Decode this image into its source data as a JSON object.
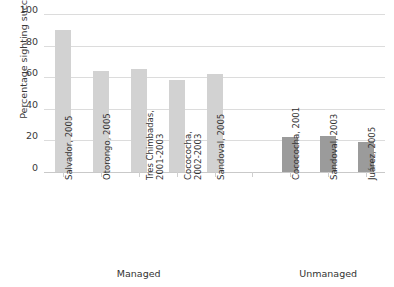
{
  "chart_data": {
    "type": "bar",
    "title": "",
    "xlabel": "",
    "ylabel": "Percentage sighting success",
    "ylim": [
      0,
      100
    ],
    "yticks": [
      0,
      20,
      40,
      60,
      80,
      100
    ],
    "grid": "horizontal",
    "legend": "none",
    "categories": [
      "Salvador, 2005",
      "Otorongo, 2005",
      "Tres Chimbadas,\n2001-2003",
      "Cocococha,\n2002-2003",
      "Sandoval, 2005",
      "",
      "Cocococha, 2001",
      "Sandoval, 2003",
      "Juárez, 2005"
    ],
    "values": [
      90,
      64,
      65,
      58,
      62,
      null,
      22,
      23,
      19
    ],
    "groups": [
      {
        "name": "Managed",
        "color": "#d2d2d2",
        "categories": [
          "Salvador, 2005",
          "Otorongo, 2005",
          "Tres Chimbadas,\n2001-2003",
          "Cocococha,\n2002-2003",
          "Sandoval, 2005"
        ],
        "values": [
          90,
          64,
          65,
          58,
          62
        ]
      },
      {
        "name": "Unmanaged",
        "color": "#9b9b9b",
        "categories": [
          "Cocococha, 2001",
          "Sandoval, 2003",
          "Juárez, 2005"
        ],
        "values": [
          22,
          23,
          19
        ]
      }
    ]
  },
  "axes": {
    "y_title": "Percentage sighting success",
    "y_tick_labels": [
      "100",
      "80",
      "60",
      "40",
      "20",
      "0"
    ]
  },
  "bars": [
    {
      "label": "Salvador, 2005",
      "value": 90,
      "color": "#d2d2d2",
      "slot": 0
    },
    {
      "label": "Otorongo, 2005",
      "value": 64,
      "color": "#d2d2d2",
      "slot": 1
    },
    {
      "label": "Tres Chimbadas,\n2001-2003",
      "value": 65,
      "color": "#d2d2d2",
      "slot": 2
    },
    {
      "label": "Cocococha,\n2002-2003",
      "value": 58,
      "color": "#d2d2d2",
      "slot": 3
    },
    {
      "label": "Sandoval, 2005",
      "value": 62,
      "color": "#d2d2d2",
      "slot": 4
    },
    {
      "label": "Cocococha, 2001",
      "value": 22,
      "color": "#9b9b9b",
      "slot": 6
    },
    {
      "label": "Sandoval, 2003",
      "value": 23,
      "color": "#9b9b9b",
      "slot": 7
    },
    {
      "label": "Juárez, 2005",
      "value": 19,
      "color": "#9b9b9b",
      "slot": 8
    }
  ],
  "group_labels": [
    {
      "text": "Managed",
      "center_slot": 2.0
    },
    {
      "text": "Unmanaged",
      "center_slot": 7.0
    }
  ],
  "colors": {
    "managed_bar": "#d2d2d2",
    "unmanaged_bar": "#9b9b9b",
    "gridline": "#dcdcdc",
    "text": "#333333",
    "background": "#ffffff"
  }
}
